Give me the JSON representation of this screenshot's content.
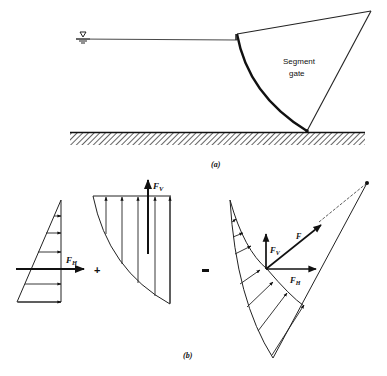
{
  "figure": {
    "part_a": {
      "caption": "(a)",
      "gate_label_line1": "Segment",
      "gate_label_line2": "gate",
      "water_surface_symbol": "free-surface-triangle"
    },
    "part_b": {
      "caption": "(b)",
      "horizontal_force_label": "F",
      "horizontal_force_sub": "H",
      "vertical_force_label": "F",
      "vertical_force_sub": "V",
      "resultant_force_label": "F",
      "plus_sign": "+",
      "equals_sign": "="
    }
  }
}
